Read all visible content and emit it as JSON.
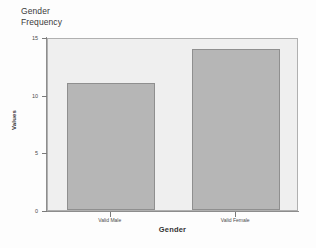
{
  "chart_data": {
    "type": "bar",
    "title": "Gender\nFrequency",
    "title_line1": "Gender",
    "title_line2": "Frequency",
    "categories": [
      "Valid Male",
      "Valid Female"
    ],
    "values": [
      11,
      14
    ],
    "xlabel": "Gender",
    "ylabel": "Values",
    "ylim": [
      0,
      15
    ],
    "yticks": [
      0,
      5,
      10,
      15
    ],
    "ytick_labels": [
      "0",
      "5",
      "10",
      "15"
    ],
    "grid": false,
    "legend": null,
    "bar_color": "#b6b6b6",
    "bar_border_color": "#8f8f8f",
    "plot_background": "#efefef",
    "axis_color": "#8d8d8d",
    "text_color": "#3a3a3a"
  }
}
